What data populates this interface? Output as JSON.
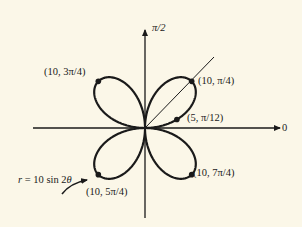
{
  "chart_data": {
    "type": "line",
    "subtype": "polar-rose",
    "title": "",
    "equation": "r = 10 sin 2θ",
    "curve_label": "r = 10 sin 2θ",
    "axis_labels": {
      "polar_axis": "0",
      "vertical_axis": "π/2"
    },
    "radial_max": 10,
    "petals": 4,
    "ray": {
      "angle": "π/4"
    },
    "points": [
      {
        "label": "(10, π/4)",
        "r": 10,
        "theta": "π/4"
      },
      {
        "label": "(10, 3π/4)",
        "r": 10,
        "theta": "3π/4"
      },
      {
        "label": "(10, 5π/4)",
        "r": 10,
        "theta": "5π/4"
      },
      {
        "label": "(10, 7π/4)",
        "r": 10,
        "theta": "7π/4"
      },
      {
        "label": "(5, π/12)",
        "r": 5,
        "theta": "π/12"
      }
    ],
    "grid": false,
    "legend": "none"
  },
  "labels": {
    "pi_over_2": "π/2",
    "zero": "0",
    "p_10_pi4": "(10, π/4)",
    "p_10_3pi4": "(10, 3π/4)",
    "p_10_5pi4": "(10, 5π/4)",
    "p_10_7pi4": "(10, 7π/4)",
    "p_5_pi12": "(5, π/12)",
    "equation": "r = 10 sin 2θ"
  },
  "colors": {
    "ink": "#1a1a1a",
    "paper": "#fbf7e8"
  }
}
